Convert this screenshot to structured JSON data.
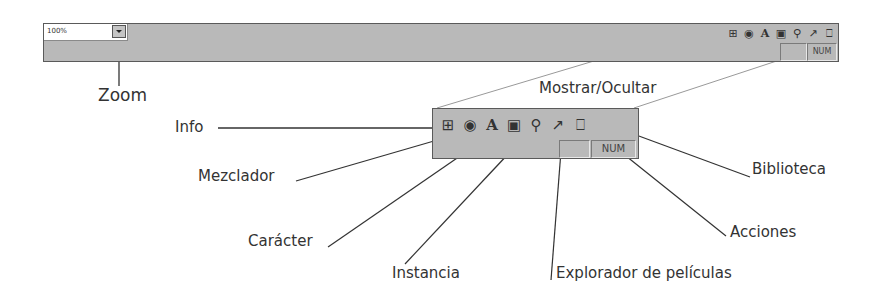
{
  "toolbar": {
    "zoom_value": "100%",
    "status": {
      "blank": "",
      "num": "NUM"
    },
    "icons": [
      {
        "name": "info-icon",
        "glyph": "⊞"
      },
      {
        "name": "mixer-icon",
        "glyph": "◉"
      },
      {
        "name": "character-icon",
        "glyph": "A"
      },
      {
        "name": "instance-icon",
        "glyph": "▣"
      },
      {
        "name": "movie-explorer-icon",
        "glyph": "⚲"
      },
      {
        "name": "actions-icon",
        "glyph": "↗"
      },
      {
        "name": "library-icon",
        "glyph": "⎕"
      }
    ]
  },
  "labels": {
    "zoom": "Zoom",
    "show_hide": "Mostrar/Ocultar",
    "info": "Info",
    "mixer": "Mezclador",
    "character": "Carácter",
    "instance": "Instancia",
    "movie_explorer": "Explorador de películas",
    "actions": "Acciones",
    "library": "Biblioteca"
  },
  "colors": {
    "bar": "#b9b9b9",
    "border": "#5a5a5a",
    "text": "#333333",
    "line": "#333333",
    "guide": "#999999"
  }
}
